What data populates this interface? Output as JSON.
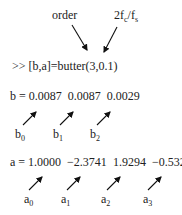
{
  "annotations": {
    "order_label": "order",
    "ratio_label": {
      "main": "2f",
      "sub1": "c",
      "mid": "/f",
      "sub2": "s"
    }
  },
  "command": ">> [b,a]=butter(3,0.1)",
  "b_line": {
    "prefix": "b = ",
    "values": [
      "0.0087",
      "0.0087",
      "0.0029"
    ],
    "labels": [
      {
        "base": "b",
        "sub": "0"
      },
      {
        "base": "b",
        "sub": "1"
      },
      {
        "base": "b",
        "sub": "2"
      }
    ]
  },
  "a_line": {
    "prefix": "a = ",
    "values": [
      "1.0000",
      "−2.3741",
      "1.9294",
      "−0.5321"
    ],
    "labels": [
      {
        "base": "a",
        "sub": "0"
      },
      {
        "base": "a",
        "sub": "1"
      },
      {
        "base": "a",
        "sub": "2"
      },
      {
        "base": "a",
        "sub": "3"
      }
    ]
  },
  "colors": {
    "text": "#222222",
    "arrow": "#111111"
  }
}
